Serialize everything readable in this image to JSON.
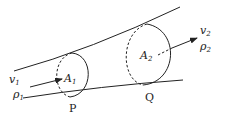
{
  "diagram": {
    "title": "",
    "type": "fluid flow through a tube (continuity equation)",
    "sections": [
      {
        "id": "P",
        "point_label": "P",
        "area_label": "A",
        "area_sub": "1",
        "velocity_label": "v",
        "velocity_sub": "1",
        "density_label": "ρ",
        "density_sub": "1"
      },
      {
        "id": "Q",
        "point_label": "Q",
        "area_label": "A",
        "area_sub": "2",
        "velocity_label": "v",
        "velocity_sub": "2",
        "density_label": "ρ",
        "density_sub": "2"
      }
    ],
    "colors": {
      "line": "#222222",
      "background": "#ffffff"
    }
  }
}
